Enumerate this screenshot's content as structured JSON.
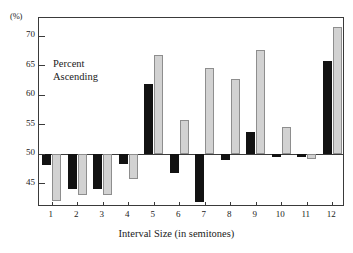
{
  "chart_data": {
    "type": "bar",
    "title": "",
    "subtitle": "",
    "annotation": "Percent Ascending",
    "annotation_lines": [
      "Percent",
      "Ascending"
    ],
    "xlabel": "Interval Size (in semitones)",
    "ylabel": "(%)",
    "categories": [
      "1",
      "2",
      "3",
      "4",
      "5",
      "6",
      "7",
      "8",
      "9",
      "10",
      "11",
      "12"
    ],
    "ylim": [
      41.0,
      73.0
    ],
    "yticks": [
      45,
      50,
      55,
      60,
      65,
      70
    ],
    "ytick_labels": [
      "45",
      "50",
      "55",
      "60",
      "65",
      "70"
    ],
    "baseline": 50,
    "grid": false,
    "legend": "none",
    "series": [
      {
        "name": "dark",
        "color": "#121212",
        "values": [
          48.1,
          44.0,
          44.0,
          48.3,
          61.8,
          46.8,
          41.9,
          48.9,
          53.7,
          49.4,
          49.4,
          65.7
        ]
      },
      {
        "name": "light",
        "color": "#d2d2d2",
        "values": [
          42.0,
          43.0,
          43.0,
          45.8,
          66.7,
          55.8,
          64.6,
          62.7,
          67.6,
          54.6,
          49.2,
          71.5
        ]
      }
    ]
  }
}
